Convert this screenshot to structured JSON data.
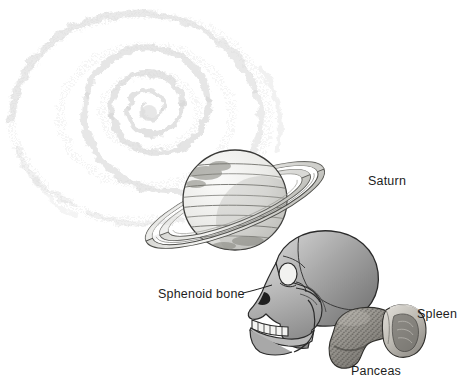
{
  "illustration": {
    "title": "Comparative scale illustration",
    "background_color": "#ffffff",
    "ink_color": "#1d1d1d",
    "objects": [
      {
        "name": "spiral-galaxy",
        "label": "",
        "labeled": false,
        "description": "faint stippled spiral galaxy, top-left",
        "color": "#d9d9d9"
      },
      {
        "name": "saturn",
        "label": "Saturn",
        "labeled": true,
        "description": "banded gas giant with tilted ring system",
        "color": "#e8e8e6"
      },
      {
        "name": "skull",
        "label": "Sphenoid bone",
        "labeled": true,
        "description": "human skull in left profile with leader line to sphenoid",
        "color": "#9a9a9a"
      },
      {
        "name": "pancreas",
        "label": "Panceas",
        "labeled": true,
        "description": "textured elongated pancreas organ",
        "color": "#8f8d88"
      },
      {
        "name": "spleen",
        "label": "Spleen",
        "labeled": true,
        "description": "cupped spleen organ adjacent to pancreas",
        "color": "#b9b6b0"
      }
    ]
  },
  "labels": {
    "saturn": "Saturn",
    "sphenoid_bone": "Sphenoid bone",
    "spleen": "Spleen",
    "panceas": "Panceas"
  }
}
